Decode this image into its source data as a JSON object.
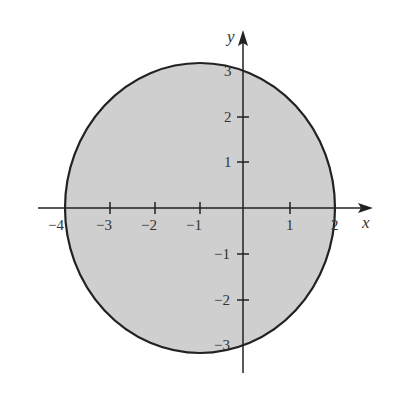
{
  "figure": {
    "region": "circle centered at (-1, 0) with radius 3, shaded interior",
    "fill_color": "#cfcfcf",
    "stroke_color": "#222222",
    "axes": {
      "x_label": "x",
      "y_label": "y",
      "x_ticks": [
        {
          "value": -4,
          "label": "−4"
        },
        {
          "value": -3,
          "label": "−3"
        },
        {
          "value": -2,
          "label": "−2"
        },
        {
          "value": -1,
          "label": "−1"
        },
        {
          "value": 1,
          "label": "1"
        },
        {
          "value": 2,
          "label": "2"
        }
      ],
      "y_ticks": [
        {
          "value": 3,
          "label": "3"
        },
        {
          "value": 2,
          "label": "2"
        },
        {
          "value": 1,
          "label": "1"
        },
        {
          "value": -1,
          "label": "−1"
        },
        {
          "value": -2,
          "label": "−2"
        },
        {
          "value": -3,
          "label": "−3"
        }
      ]
    }
  }
}
